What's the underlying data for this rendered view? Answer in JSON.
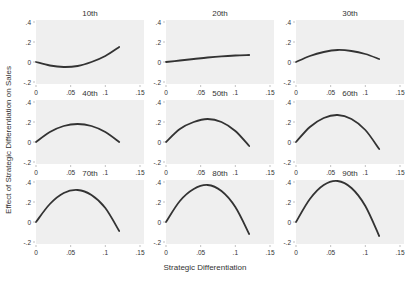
{
  "chart_data": {
    "type": "line",
    "xlabel": "Strategic Differentiation",
    "ylabel": "Effect of Strategic Differentiation on Sales",
    "xlim": [
      0,
      0.15
    ],
    "ylim": [
      -0.2,
      0.4
    ],
    "xticks": [
      "0",
      ".05",
      ".1",
      ".15"
    ],
    "xtick_values": [
      0,
      0.05,
      0.1,
      0.15
    ],
    "yticks": [
      "-.2",
      "0",
      ".2",
      ".4"
    ],
    "ytick_values": [
      -0.2,
      0,
      0.2,
      0.4
    ],
    "grid": false,
    "layout": {
      "rows": 3,
      "cols": 3
    },
    "line_color": "#333333",
    "panel_background": "#efefef",
    "x_range_plotted": [
      0,
      0.12
    ],
    "panels": [
      {
        "title": "10th",
        "x": [
          0,
          0.02,
          0.04,
          0.06,
          0.08,
          0.1,
          0.12
        ],
        "values": [
          0,
          -0.035,
          -0.05,
          -0.04,
          0.0,
          0.06,
          0.15
        ]
      },
      {
        "title": "20th",
        "x": [
          0,
          0.02,
          0.04,
          0.06,
          0.08,
          0.1,
          0.12
        ],
        "values": [
          0,
          0.015,
          0.03,
          0.045,
          0.057,
          0.065,
          0.07
        ]
      },
      {
        "title": "30th",
        "x": [
          0,
          0.02,
          0.04,
          0.06,
          0.08,
          0.1,
          0.12
        ],
        "values": [
          0,
          0.06,
          0.1,
          0.12,
          0.11,
          0.08,
          0.03
        ]
      },
      {
        "title": "40th",
        "x": [
          0,
          0.02,
          0.04,
          0.06,
          0.08,
          0.1,
          0.12
        ],
        "values": [
          0,
          0.1,
          0.16,
          0.18,
          0.16,
          0.1,
          0.0
        ]
      },
      {
        "title": "50th",
        "x": [
          0,
          0.02,
          0.04,
          0.06,
          0.08,
          0.1,
          0.12
        ],
        "values": [
          0,
          0.13,
          0.2,
          0.23,
          0.2,
          0.11,
          -0.04
        ]
      },
      {
        "title": "60th",
        "x": [
          0,
          0.02,
          0.04,
          0.06,
          0.08,
          0.1,
          0.12
        ],
        "values": [
          0,
          0.15,
          0.24,
          0.27,
          0.23,
          0.12,
          -0.07
        ]
      },
      {
        "title": "70th",
        "x": [
          0,
          0.02,
          0.04,
          0.06,
          0.08,
          0.1,
          0.12
        ],
        "values": [
          0,
          0.18,
          0.29,
          0.32,
          0.27,
          0.14,
          -0.09
        ]
      },
      {
        "title": "80th",
        "x": [
          0,
          0.02,
          0.04,
          0.06,
          0.08,
          0.1,
          0.12
        ],
        "values": [
          0,
          0.21,
          0.33,
          0.37,
          0.31,
          0.15,
          -0.12
        ]
      },
      {
        "title": "90th",
        "x": [
          0,
          0.02,
          0.04,
          0.06,
          0.08,
          0.1,
          0.12
        ],
        "values": [
          0,
          0.23,
          0.37,
          0.41,
          0.34,
          0.16,
          -0.14
        ]
      }
    ]
  }
}
